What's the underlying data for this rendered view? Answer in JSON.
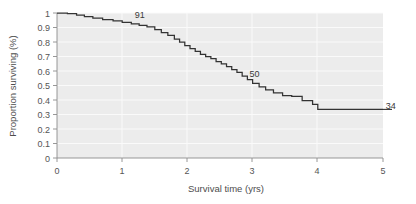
{
  "chart_data": {
    "type": "line",
    "subtype": "kaplan-meier-step",
    "title": "",
    "xlabel": "Survival time (yrs)",
    "ylabel": "Proportion surviving (%)",
    "xlim": [
      0,
      5
    ],
    "ylim": [
      0,
      1
    ],
    "xticks": [
      0,
      1,
      2,
      3,
      4,
      5
    ],
    "xtick_labels": [
      "0",
      "1",
      "2",
      "3",
      "4",
      "5"
    ],
    "yticks": [
      0,
      0.1,
      0.2,
      0.3,
      0.4,
      0.5,
      0.6,
      0.7,
      0.8,
      0.9,
      1
    ],
    "ytick_labels": [
      "0",
      "0.1",
      "0.2",
      "0.3",
      "0.4",
      "0.5",
      "0.6",
      "0.7",
      "0.8",
      "0.9",
      "1"
    ],
    "grid": true,
    "grid_color": "#fafafa",
    "plot_background": "#ececec",
    "figure_background": "#ffffff",
    "legend": "none",
    "series": [
      {
        "name": "survival",
        "color": "#333333",
        "step": "post",
        "x": [
          0.0,
          0.16,
          0.3,
          0.42,
          0.55,
          0.7,
          0.86,
          1.0,
          1.14,
          1.26,
          1.38,
          1.5,
          1.6,
          1.7,
          1.8,
          1.88,
          1.96,
          2.04,
          2.12,
          2.2,
          2.28,
          2.36,
          2.44,
          2.52,
          2.6,
          2.68,
          2.76,
          2.84,
          2.92,
          3.0,
          3.1,
          3.2,
          3.32,
          3.46,
          3.6,
          3.76,
          3.92,
          4.0,
          4.7,
          5.0
        ],
        "y": [
          1.0,
          0.995,
          0.985,
          0.975,
          0.965,
          0.955,
          0.945,
          0.935,
          0.925,
          0.915,
          0.905,
          0.885,
          0.865,
          0.845,
          0.82,
          0.8,
          0.775,
          0.755,
          0.735,
          0.715,
          0.7,
          0.685,
          0.665,
          0.65,
          0.63,
          0.61,
          0.59,
          0.565,
          0.54,
          0.515,
          0.49,
          0.47,
          0.45,
          0.43,
          0.425,
          0.395,
          0.37,
          0.335,
          0.335,
          0.335
        ]
      }
    ],
    "annotations": [
      {
        "text": "91",
        "x_data": 1.27,
        "y_data": 0.965,
        "name": "at-risk-label-91"
      },
      {
        "text": "50",
        "x_data": 3.03,
        "y_data": 0.56,
        "name": "at-risk-label-50"
      },
      {
        "text": "34",
        "x_data": 5.12,
        "y_data": 0.335,
        "name": "at-risk-label-34"
      }
    ]
  }
}
